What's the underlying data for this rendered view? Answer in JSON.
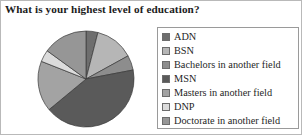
{
  "chart_title": "What is your highest level of education?",
  "legend": {
    "position": "right",
    "items": [
      {
        "label": "ADN",
        "color": "#6e6e6e"
      },
      {
        "label": "BSN",
        "color": "#b6b6b6"
      },
      {
        "label": "Bachelors in another field",
        "color": "#8d8d8d"
      },
      {
        "label": "MSN",
        "color": "#5a5a5a"
      },
      {
        "label": "Masters in another field",
        "color": "#a3a3a3"
      },
      {
        "label": "DNP",
        "color": "#dcdcdc"
      },
      {
        "label": "Doctorate in another field",
        "color": "#969696"
      }
    ]
  },
  "chart_data": {
    "type": "pie",
    "title": "What is your highest level of education?",
    "xlabel": "",
    "ylabel": "",
    "legend_position": "right",
    "grid": false,
    "start_angle_deg": 0,
    "direction": "clockwise",
    "categories": [
      "ADN",
      "BSN",
      "Bachelors in another field",
      "MSN",
      "Masters in another field",
      "DNP",
      "Doctorate in another field"
    ],
    "values": [
      4,
      13,
      5,
      42,
      17,
      4,
      15
    ],
    "colors": [
      "#6e6e6e",
      "#b6b6b6",
      "#8d8d8d",
      "#5a5a5a",
      "#a3a3a3",
      "#dcdcdc",
      "#969696"
    ],
    "units": "percent",
    "center_px": [
      85,
      78
    ],
    "radius_px": 48
  }
}
